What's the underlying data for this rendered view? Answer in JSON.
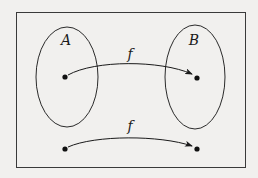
{
  "diagram": {
    "type": "function-mapping",
    "colors": {
      "background": "#f1f0ee",
      "stroke": "#2a2a2a",
      "ink": "#111111"
    },
    "sets": [
      {
        "id": "A",
        "label": "A",
        "cx": 67,
        "cy": 77,
        "rx": 31,
        "ry": 50,
        "label_x": 66,
        "label_y": 45
      },
      {
        "id": "B",
        "label": "B",
        "cx": 195,
        "cy": 77,
        "rx": 30,
        "ry": 52,
        "label_x": 194,
        "label_y": 45
      }
    ],
    "mappings": [
      {
        "label": "f",
        "label_x": 130,
        "label_y": 59,
        "from": {
          "x": 65,
          "y": 77
        },
        "to": {
          "x": 197,
          "y": 78
        },
        "path": "M 68 75 C 95 60, 160 60, 192 74"
      },
      {
        "label": "f",
        "label_x": 130,
        "label_y": 131,
        "from": {
          "x": 65,
          "y": 149
        },
        "to": {
          "x": 197,
          "y": 149
        },
        "path": "M 68 147 C 95 135, 160 135, 192 146"
      }
    ],
    "frame": {
      "x": 16,
      "y": 12,
      "width": 230,
      "height": 156
    }
  }
}
